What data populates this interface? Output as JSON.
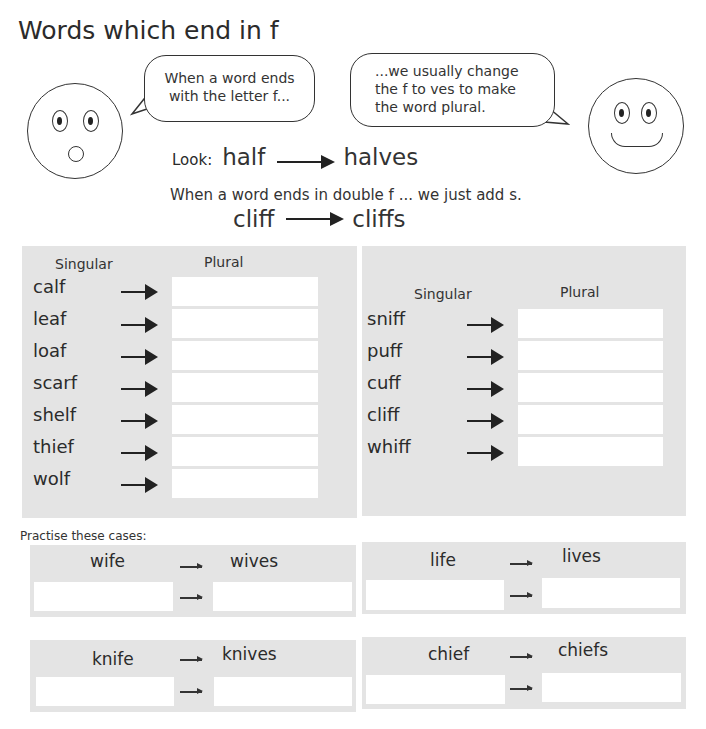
{
  "title": "Words which end in f",
  "bubbles": {
    "left": [
      "When a word ends",
      "with the letter f..."
    ],
    "right": [
      "...we usually change",
      "the f to ves to make",
      "the word plural."
    ]
  },
  "example": {
    "look_label": "Look:",
    "singular": "half",
    "plural": "halves",
    "double_note": "When a word ends in double f ... we just add s.",
    "double_singular": "cliff",
    "double_plural": "cliffs"
  },
  "left_table": {
    "singular_header": "Singular",
    "plural_header": "Plural",
    "words": [
      "calf",
      "leaf",
      "loaf",
      "scarf",
      "shelf",
      "thief",
      "wolf"
    ]
  },
  "right_table": {
    "singular_header": "Singular",
    "plural_header": "Plural",
    "words": [
      "sniff",
      "puff",
      "cuff",
      "cliff",
      "whiff"
    ]
  },
  "practise": {
    "label": "Practise these cases:",
    "cases": [
      {
        "singular": "wife",
        "plural": "wives"
      },
      {
        "singular": "life",
        "plural": "lives"
      },
      {
        "singular": "knife",
        "plural": "knives"
      },
      {
        "singular": "chief",
        "plural": "chiefs"
      }
    ]
  }
}
